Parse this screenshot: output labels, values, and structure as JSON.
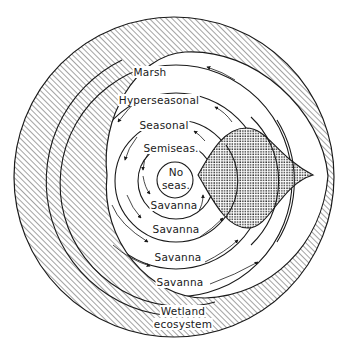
{
  "diagram": {
    "rings": [
      {
        "id": "no-seas",
        "label_line1": "No",
        "label_line2": "seas."
      },
      {
        "id": "semiseas",
        "label": "Semiseas."
      },
      {
        "id": "seasonal",
        "label": "Seasonal"
      },
      {
        "id": "hyperseasonal",
        "label": "Hyperseasonal"
      },
      {
        "id": "marsh",
        "label": "Marsh"
      }
    ],
    "savanna_labels": [
      "Savanna",
      "Savanna",
      "Savanna",
      "Savanna"
    ],
    "outer_zone": {
      "label_line1": "Wetland",
      "label_line2": "ecosystem"
    },
    "colors": {
      "ink": "#1a1a1a",
      "paper": "#ffffff"
    }
  }
}
